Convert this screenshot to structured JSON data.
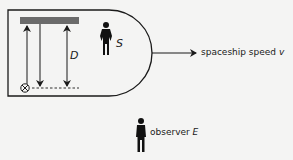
{
  "diagram": {
    "spaceship": {
      "frame_label": "S",
      "distance_label": "D",
      "mirror_color": "#6b6b6b",
      "outline_color": "#1a1a1a"
    },
    "velocity": {
      "text": "spaceship speed ",
      "variable": "v"
    },
    "observer": {
      "text": "observer ",
      "variable": "E"
    },
    "colors": {
      "background": "#f4f4f3",
      "ink": "#1a1a1a"
    }
  }
}
